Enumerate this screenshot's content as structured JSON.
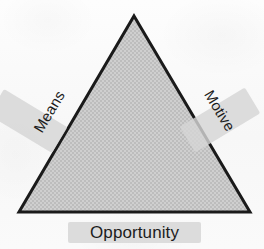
{
  "diagram": {
    "type": "triangle",
    "shape": {
      "name": "triangle",
      "fill_color": "#c9c9c9",
      "border_color": "#1a1a1a",
      "border_width": 3,
      "apex": {
        "x": 134,
        "y": 16
      },
      "bottom_left": {
        "x": 19,
        "y": 212
      },
      "bottom_right": {
        "x": 250,
        "y": 212
      }
    },
    "background_color": "#fafafa",
    "highlight_color": "#d5d5d5",
    "text_color": "#1c1c1c",
    "labels": [
      {
        "id": "means",
        "text": "Means",
        "side": "left",
        "rotation": -59
      },
      {
        "id": "motive",
        "text": "Motive",
        "side": "right",
        "rotation": 59
      },
      {
        "id": "opportunity",
        "text": "Opportunity",
        "side": "bottom",
        "rotation": 0
      }
    ]
  }
}
